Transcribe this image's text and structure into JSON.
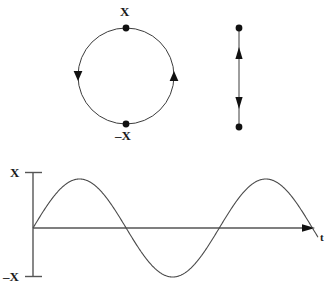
{
  "figure": {
    "background_color": "#ffffff",
    "line_color": "#3c3c3c",
    "marker_color": "#111111",
    "axis_color": "#555555"
  },
  "circle_diagram": {
    "name": "uniform-circular-motion",
    "center_x": 126,
    "center_y": 76,
    "radius": 48,
    "top_label": "X",
    "bottom_label": "–X",
    "points": [
      {
        "label": "X",
        "x": 126,
        "y": 28,
        "angle_deg": 90
      },
      {
        "label": "–X",
        "x": 126,
        "y": 124,
        "angle_deg": 270
      }
    ],
    "arrows": [
      {
        "name": "left-arrow",
        "direction": "down",
        "x": 78,
        "y": 76
      },
      {
        "name": "right-arrow",
        "direction": "up",
        "x": 174,
        "y": 76
      }
    ],
    "rotation_sense": "counterclockwise"
  },
  "projection_diagram": {
    "name": "vertical-oscillation",
    "x": 239,
    "top_y": 28,
    "bottom_y": 127,
    "arrows": [
      {
        "name": "upper-arrow",
        "direction": "up",
        "x": 239,
        "y": 52
      },
      {
        "name": "lower-arrow",
        "direction": "down",
        "x": 239,
        "y": 104
      }
    ],
    "endpoints": [
      {
        "x": 239,
        "y": 28
      },
      {
        "x": 239,
        "y": 127
      }
    ]
  },
  "chart_data": {
    "type": "line",
    "title": "",
    "subtitle": "",
    "xlabel": "t",
    "ylabel": "",
    "ytick_labels": [
      "X",
      "–X"
    ],
    "xtick_labels": [],
    "grid": false,
    "legend": null,
    "ylim": [
      -1,
      1
    ],
    "xlim": [
      0,
      1.53
    ],
    "amplitude": 1,
    "periods_shown": 1.53,
    "waveform": "sine",
    "phase": 0,
    "axis_origin": {
      "x": 33,
      "y": 228
    },
    "axis_top": {
      "x": 33,
      "y": 172
    },
    "axis_bottom": {
      "x": 33,
      "y": 277
    },
    "axis_right_end": {
      "x": 318,
      "y": 228
    },
    "series": [
      {
        "name": "displacement",
        "x": [
          0,
          0.125,
          0.25,
          0.375,
          0.5,
          0.625,
          0.75,
          0.875,
          1.0,
          1.125,
          1.25,
          1.375,
          1.5,
          1.53
        ],
        "values": [
          0,
          0.707,
          1.0,
          0.707,
          0,
          -0.707,
          -1.0,
          -0.707,
          0,
          0.707,
          1.0,
          0.707,
          0,
          -0.19
        ]
      }
    ],
    "annotations": [
      {
        "name": "y-top-tick-label",
        "text": "X",
        "x": 10,
        "y": 173
      },
      {
        "name": "y-bottom-tick-label",
        "text": "–X",
        "x": 4,
        "y": 278
      },
      {
        "name": "x-axis-label",
        "text": "t",
        "x": 321,
        "y": 239
      }
    ]
  },
  "labels": {
    "circle_top": "X",
    "circle_bottom": "–X",
    "graph_y_max": "X",
    "graph_y_min": "–X",
    "graph_x_axis": "t"
  }
}
